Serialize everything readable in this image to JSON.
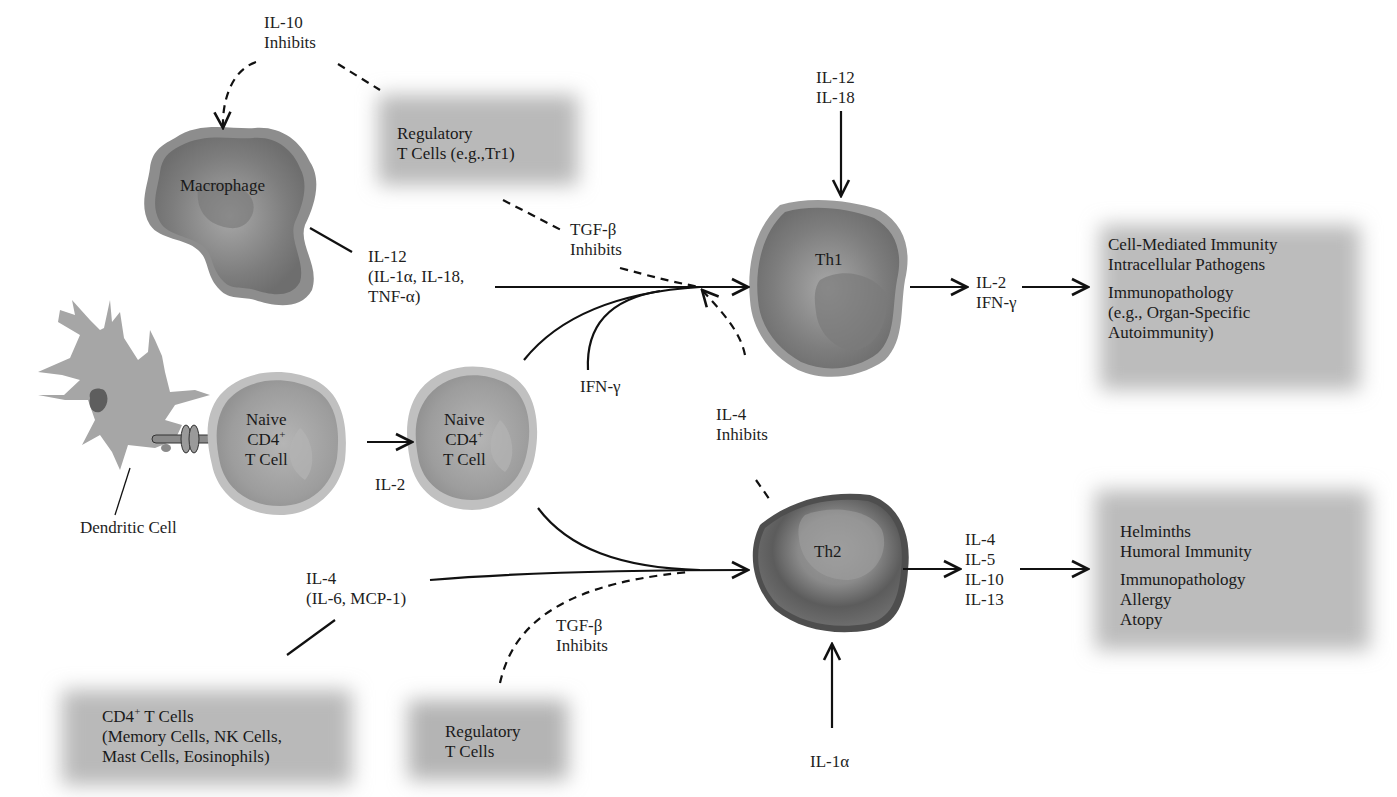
{
  "cells": {
    "macrophage": {
      "label": "Macrophage"
    },
    "dendritic": {
      "label": "Dendritic Cell"
    },
    "naive1": {
      "line1": "Naive",
      "line2": "CD4",
      "sup": "+",
      "line3": "T Cell"
    },
    "naive2": {
      "line1": "Naive",
      "line2": "CD4",
      "sup": "+",
      "line3": "T Cell"
    },
    "th1": {
      "label": "Th1"
    },
    "th2": {
      "label": "Th2"
    }
  },
  "boxes": {
    "treg_top": {
      "line1": "Regulatory",
      "line2": "T Cells (e.g.,Tr1)"
    },
    "th1_outcomes": {
      "line1": "Cell-Mediated Immunity",
      "line2": "Intracellular Pathogens",
      "line3": "Immunopathology",
      "line4": "(e.g., Organ-Specific",
      "line5": "Autoimmunity)"
    },
    "th2_outcomes": {
      "line1": "Helminths",
      "line2": "Humoral Immunity",
      "line3": "Immunopathology",
      "line4": "Allergy",
      "line5": "Atopy"
    },
    "cd4_sources": {
      "line1a": "CD4",
      "line1sup": "+",
      "line1b": " T Cells",
      "line2": "(Memory Cells, NK Cells,",
      "line3": "Mast Cells, Eosinophils)"
    },
    "treg_bottom": {
      "line1": "Regulatory",
      "line2": "T Cells"
    }
  },
  "labels": {
    "il10_inhibits": {
      "line1": "IL-10",
      "line2": "Inhibits"
    },
    "il12_group": {
      "line1": "IL-12",
      "line2": "(IL-1α, IL-18,",
      "line3": "TNF-α)"
    },
    "tgfb_top": {
      "line1": "TGF-β",
      "line2": "Inhibits"
    },
    "il12_il18": {
      "line1": "IL-12",
      "line2": "IL-18"
    },
    "ifng": "IFN-γ",
    "il2_ifng": {
      "line1": "IL-2",
      "line2": "IFN-γ"
    },
    "il2": "IL-2",
    "il4_inhibits": {
      "line1": "IL-4",
      "line2": "Inhibits"
    },
    "il4_group": {
      "line1": "IL-4",
      "line2": "(IL-6, MCP-1)"
    },
    "tgfb_bottom": {
      "line1": "TGF-β",
      "line2": "Inhibits"
    },
    "th2_cytokines": {
      "line1": "IL-4",
      "line2": "IL-5",
      "line3": "IL-10",
      "line4": "IL-13"
    },
    "il1a": "IL-1α"
  },
  "colors": {
    "cell_outer": "#9a9a9a",
    "cell_inner": "#7a7a7a",
    "naive_outer": "#b8b8b8",
    "naive_inner": "#9c9c9c",
    "box_fill": "#bdbdbd",
    "line": "#111111"
  }
}
